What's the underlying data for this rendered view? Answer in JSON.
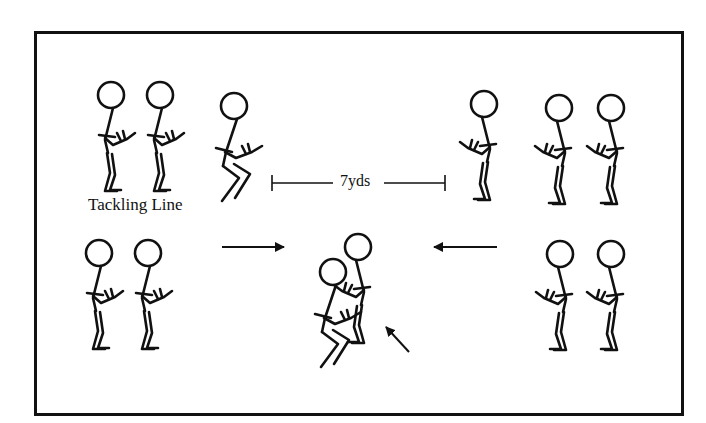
{
  "diagram": {
    "title": "",
    "labels": {
      "tackling_line": "Tackling Line",
      "distance": "7yds"
    },
    "colors": {
      "ink": "#111111",
      "background": "#ffffff"
    },
    "figures": [
      {
        "id": "tackler-line-1",
        "pose": "stand",
        "facing": "right",
        "x": 111,
        "y": 95
      },
      {
        "id": "tackler-line-2",
        "pose": "stand",
        "facing": "right",
        "x": 160,
        "y": 95
      },
      {
        "id": "tackler-ready",
        "pose": "crouch",
        "facing": "right",
        "x": 234,
        "y": 106
      },
      {
        "id": "ballcarrier-ready",
        "pose": "stand",
        "facing": "left",
        "x": 484,
        "y": 104
      },
      {
        "id": "ballcarrier-line-1",
        "pose": "stand",
        "facing": "left",
        "x": 559,
        "y": 108
      },
      {
        "id": "ballcarrier-line-2",
        "pose": "stand",
        "facing": "left",
        "x": 611,
        "y": 108
      },
      {
        "id": "tackler-line-3",
        "pose": "stand",
        "facing": "right",
        "x": 99,
        "y": 253
      },
      {
        "id": "tackler-line-4",
        "pose": "stand",
        "facing": "right",
        "x": 148,
        "y": 253
      },
      {
        "id": "tackle-tackler",
        "pose": "crouch",
        "facing": "right",
        "x": 333,
        "y": 272
      },
      {
        "id": "tackle-ballcarrier",
        "pose": "stand",
        "facing": "left",
        "x": 358,
        "y": 247
      },
      {
        "id": "ballcarrier-line-3",
        "pose": "stand",
        "facing": "left",
        "x": 560,
        "y": 254
      },
      {
        "id": "ballcarrier-line-4",
        "pose": "stand",
        "facing": "left",
        "x": 611,
        "y": 254
      }
    ],
    "arrows": [
      {
        "id": "arrow-tackler-direction",
        "x1": 222,
        "y1": 247,
        "x2": 284,
        "y2": 247
      },
      {
        "id": "arrow-ballcarrier-direction",
        "x1": 497,
        "y1": 247,
        "x2": 434,
        "y2": 247
      },
      {
        "id": "arrow-contact-point",
        "x1": 409,
        "y1": 352,
        "x2": 386,
        "y2": 327
      }
    ],
    "distance_marker": {
      "x1": 272,
      "x2": 445,
      "y": 183,
      "gap_left": 333,
      "gap_right": 384
    }
  }
}
